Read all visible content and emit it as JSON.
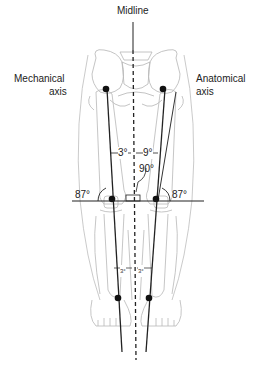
{
  "diagram": {
    "labels": {
      "midline": "Midline",
      "mechanical_axis_line1": "Mechanical",
      "mechanical_axis_line2": "axis",
      "anatomical_axis_line1": "Anatomical",
      "anatomical_axis_line2": "axis"
    },
    "angles": {
      "mechanical_to_vertical": "3°",
      "anatomical_to_mechanical": "9°",
      "knee_joint_line": "90°",
      "left_knee": "87°",
      "right_knee": "87°",
      "lower_left": "3°",
      "lower_right": "3°"
    },
    "colors": {
      "bone_outline": "#b8b8b8",
      "axis_line": "#222222",
      "text": "#222222"
    }
  }
}
